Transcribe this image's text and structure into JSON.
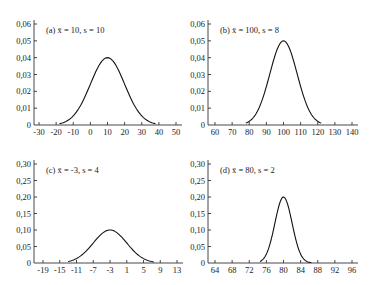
{
  "chart_data": [
    {
      "type": "line",
      "title": "(a) x̄ = 10, s = 10",
      "label": "(a)",
      "mean": 10,
      "sd": 10,
      "xlabel": "",
      "ylabel": "",
      "x_ticks": [
        -30,
        -20,
        -10,
        0,
        10,
        20,
        30,
        40,
        50
      ],
      "y_ticks": [
        "0",
        "0,01",
        "0,02",
        "0,03",
        "0,04",
        "0,05",
        "0,06"
      ],
      "xlim": [
        -30,
        50
      ],
      "ylim": [
        0,
        0.06
      ],
      "curve_range": [
        -18,
        38
      ],
      "peak": {
        "x": 10,
        "y": 0.04
      },
      "grid": false
    },
    {
      "type": "line",
      "title": "(b) x̄ = 100, s = 8",
      "label": "(b)",
      "mean": 100,
      "sd": 8,
      "xlabel": "",
      "ylabel": "",
      "x_ticks": [
        60,
        70,
        80,
        90,
        100,
        110,
        120,
        130,
        140
      ],
      "y_ticks": [
        "0",
        "0,01",
        "0,02",
        "0,03",
        "0,04",
        "0,05",
        "0,06"
      ],
      "xlim": [
        60,
        140
      ],
      "ylim": [
        0,
        0.06
      ],
      "curve_range": [
        78,
        122
      ],
      "peak": {
        "x": 100,
        "y": 0.05
      },
      "grid": false
    },
    {
      "type": "line",
      "title": "(c) x̄ = -3, s = 4",
      "label": "(c)",
      "mean": -3,
      "sd": 4,
      "xlabel": "",
      "ylabel": "",
      "x_ticks": [
        -19,
        -15,
        -11,
        -7,
        -3,
        1,
        5,
        9,
        13
      ],
      "y_ticks": [
        "0",
        "0,05",
        "0,10",
        "0,15",
        "0,20",
        "0,25",
        "0,30"
      ],
      "xlim": [
        -19,
        13
      ],
      "ylim": [
        0,
        0.3
      ],
      "curve_range": [
        -13,
        7.5
      ],
      "peak": {
        "x": -3,
        "y": 0.1
      },
      "grid": false
    },
    {
      "type": "line",
      "title": "(d) x̄ = 80, s = 2",
      "label": "(d)",
      "mean": 80,
      "sd": 2,
      "xlabel": "",
      "ylabel": "",
      "x_ticks": [
        64,
        68,
        72,
        76,
        80,
        84,
        88,
        92,
        96
      ],
      "y_ticks": [
        "0",
        "0,05",
        "0,10",
        "0,15",
        "0,20",
        "0,25",
        "0,30"
      ],
      "xlim": [
        64,
        96
      ],
      "ylim": [
        0,
        0.3
      ],
      "curve_range": [
        74.5,
        86.5
      ],
      "peak": {
        "x": 80,
        "y": 0.2
      },
      "grid": false
    }
  ]
}
